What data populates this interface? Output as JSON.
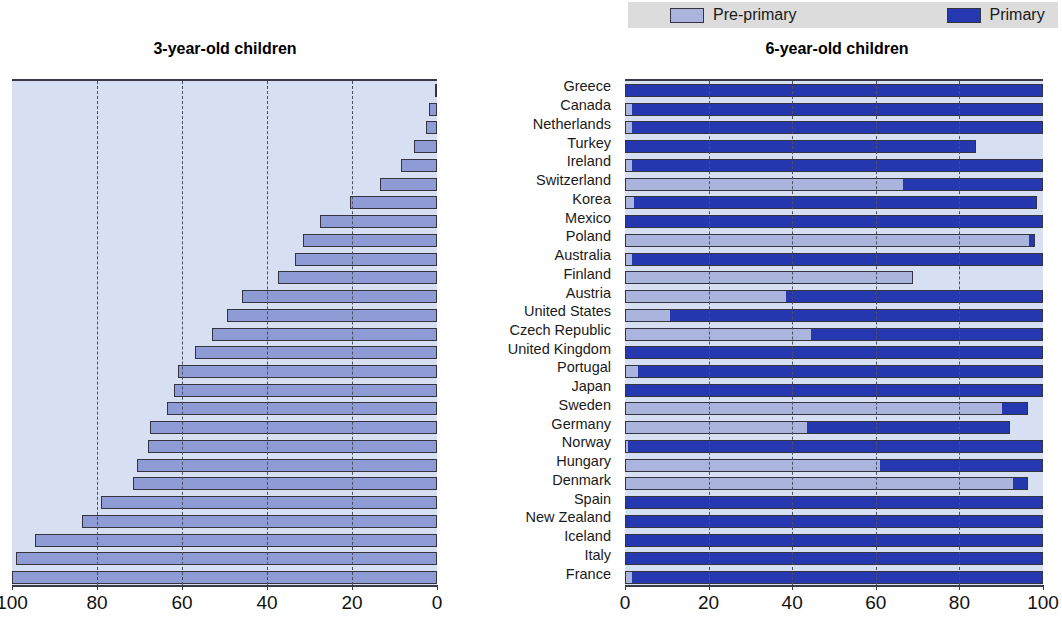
{
  "legend": {
    "items": [
      {
        "label": "Pre-primary",
        "color": "#aab4dd",
        "key": "pre"
      },
      {
        "label": "Primary",
        "color": "#2638b0",
        "key": "pri"
      }
    ]
  },
  "charts": {
    "left": {
      "title": "3-year-old children",
      "xlabel": "",
      "ticks": [
        100,
        80,
        60,
        40,
        20,
        0
      ],
      "xlim": [
        100,
        0
      ],
      "reversed": true
    },
    "right": {
      "title": "6-year-old children",
      "xlabel": "",
      "ticks": [
        0,
        20,
        40,
        60,
        80,
        100
      ],
      "xlim": [
        0,
        100
      ],
      "reversed": false
    }
  },
  "chart_data": {
    "type": "bar",
    "orientation": "horizontal",
    "panels": [
      {
        "name": "left",
        "title": "3-year-old children",
        "type": "bar",
        "xlabel": "",
        "ylabel": "",
        "xlim": [
          100,
          0
        ],
        "xticks": [
          100,
          80,
          60,
          40,
          20,
          0
        ],
        "grid": "vertical-dashed",
        "series": [
          {
            "name": "Pre-primary",
            "color": "#8f9bd4",
            "values": [
              0.5,
              2.5,
              5.5,
              8.5,
              13.5,
              20.5,
              27.5,
              31.5,
              33.5,
              37.5,
              46.0,
              49.5,
              53.0,
              57.0,
              61.0,
              62.0,
              63.5,
              67.5,
              68.0,
              70.5,
              71.5,
              79.0,
              83.5,
              94.5,
              99.0,
              100.0
            ]
          }
        ]
      },
      {
        "name": "right",
        "title": "6-year-old children",
        "type": "stacked-bar",
        "xlabel": "",
        "ylabel": "",
        "xlim": [
          0,
          100
        ],
        "xticks": [
          0,
          20,
          40,
          60,
          80,
          100
        ],
        "grid": "vertical-dashed",
        "series": [
          {
            "name": "Pre-primary",
            "color": "#aab4dd",
            "values": [
              0.0,
              1.5,
              1.5,
              0.0,
              1.5,
              66.5,
              2.0,
              0.0,
              97.0,
              1.5,
              69.0,
              38.5,
              10.5,
              44.5,
              0.0,
              3.0,
              0.0,
              90.5,
              43.5,
              0.5,
              61.0,
              93.0,
              0.0,
              0.0,
              0.0,
              1.5
            ]
          },
          {
            "name": "Primary",
            "color": "#2638b0",
            "values": [
              100.0,
              98.5,
              98.5,
              84.0,
              98.5,
              33.5,
              96.5,
              100.0,
              1.0,
              98.5,
              0.0,
              61.5,
              89.5,
              55.5,
              100.0,
              97.0,
              100.0,
              6.0,
              48.5,
              99.5,
              39.0,
              3.5,
              100.0,
              100.0,
              100.0,
              98.5
            ]
          }
        ]
      }
    ],
    "categories": [
      "Greece",
      "Canada",
      "Netherlands",
      "Turkey",
      "Ireland",
      "Switzerland",
      "Korea",
      "Mexico",
      "Poland",
      "Australia",
      "Finland",
      "Austria",
      "United States",
      "Czech Republic",
      "United Kingdom",
      "Portugal",
      "Japan",
      "Sweden",
      "Germany",
      "Norway",
      "Hungary",
      "Denmark",
      "Spain",
      "New Zealand",
      "Iceland",
      "Italy",
      "France"
    ]
  },
  "countries": [
    "Greece",
    "Canada",
    "Netherlands",
    "Turkey",
    "Ireland",
    "Switzerland",
    "Korea",
    "Mexico",
    "Poland",
    "Australia",
    "Finland",
    "Austria",
    "United States",
    "Czech Republic",
    "United Kingdom",
    "Portugal",
    "Japan",
    "Sweden",
    "Germany",
    "Norway",
    "Hungary",
    "Denmark",
    "Spain",
    "New Zealand",
    "Iceland",
    "Italy",
    "France"
  ],
  "left_values": [
    0.5,
    2.0,
    2.5,
    5.5,
    8.5,
    13.5,
    20.5,
    27.5,
    31.5,
    33.5,
    37.5,
    46.0,
    49.5,
    53.0,
    57.0,
    61.0,
    62.0,
    63.5,
    67.5,
    68.0,
    70.5,
    71.5,
    79.0,
    83.5,
    94.5,
    99.0,
    100.0
  ],
  "right_pre": [
    0.0,
    1.5,
    1.5,
    0.0,
    1.5,
    66.5,
    2.0,
    0.0,
    97.0,
    1.5,
    69.0,
    38.5,
    10.5,
    44.5,
    0.0,
    3.0,
    0.0,
    90.5,
    43.5,
    0.5,
    61.0,
    93.0,
    0.0,
    0.0,
    0.0,
    0.0,
    1.5
  ],
  "right_pri": [
    100.0,
    98.5,
    98.5,
    84.0,
    98.5,
    33.5,
    96.5,
    100.0,
    1.0,
    98.5,
    0.0,
    61.5,
    89.5,
    55.5,
    100.0,
    97.0,
    100.0,
    6.0,
    48.5,
    99.5,
    39.0,
    3.5,
    100.0,
    100.0,
    100.0,
    100.0,
    98.5
  ]
}
